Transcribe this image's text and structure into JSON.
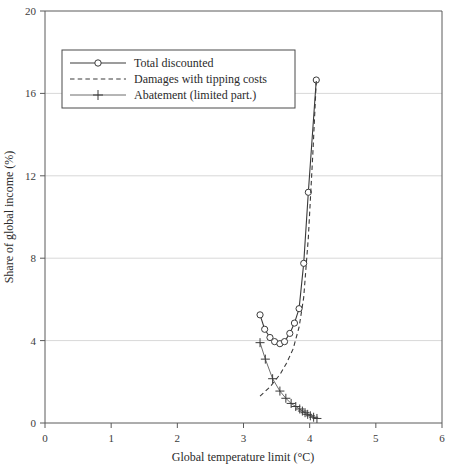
{
  "chart_data": {
    "type": "line",
    "title": "",
    "xlabel": "Global temperature limit (°C)",
    "ylabel": "Share of global income (%)",
    "xlim": [
      0,
      6
    ],
    "ylim": [
      0,
      20
    ],
    "xticks": [
      "0",
      "1",
      "2",
      "3",
      "4",
      "5",
      "6"
    ],
    "xtick_values": [
      0,
      1,
      2,
      3,
      4,
      5,
      6
    ],
    "yticks": [
      "0",
      "4",
      "8",
      "12",
      "16",
      "20"
    ],
    "ytick_values": [
      0,
      4,
      8,
      12,
      16,
      20
    ],
    "grid": "horizontal",
    "legend_position": "upper-left",
    "series": [
      {
        "name": "Total discounted",
        "marker": "circle",
        "linestyle": "solid",
        "color": "#3a3a3a",
        "x": [
          3.25,
          3.32,
          3.4,
          3.47,
          3.55,
          3.62,
          3.7,
          3.77,
          3.84,
          3.91,
          3.98,
          4.1
        ],
        "values": [
          5.25,
          4.55,
          4.15,
          3.95,
          3.85,
          3.95,
          4.35,
          4.85,
          5.55,
          7.75,
          11.2,
          16.65
        ]
      },
      {
        "name": "Damages with tipping costs",
        "marker": "none",
        "linestyle": "dashed",
        "color": "#3a3a3a",
        "x": [
          3.25,
          3.4,
          3.55,
          3.65,
          3.75,
          3.84,
          3.91,
          3.98,
          4.05,
          4.1
        ],
        "values": [
          1.3,
          1.75,
          2.35,
          2.9,
          3.6,
          4.65,
          6.1,
          9.0,
          13.2,
          16.6
        ]
      },
      {
        "name": "Abatement (limited part.)",
        "marker": "plus",
        "linestyle": "solid",
        "color": "#5c5c5c",
        "x": [
          3.25,
          3.33,
          3.44,
          3.55,
          3.64,
          3.72,
          3.79,
          3.85,
          3.89,
          3.93,
          3.97,
          4.01,
          4.06,
          4.11
        ],
        "values": [
          3.9,
          3.1,
          2.15,
          1.55,
          1.2,
          0.95,
          0.8,
          0.68,
          0.58,
          0.5,
          0.42,
          0.35,
          0.28,
          0.22
        ]
      }
    ]
  },
  "legend": {
    "entries": [
      {
        "label": "Total discounted"
      },
      {
        "label": "Damages with tipping costs"
      },
      {
        "label": "Abatement (limited part.)"
      }
    ]
  }
}
